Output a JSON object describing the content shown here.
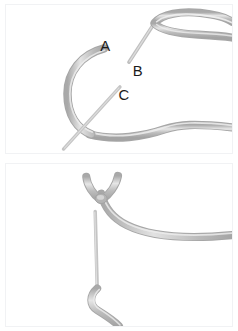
{
  "figure": {
    "type": "instructional-diagram",
    "panel_count": 2,
    "background_color": "#ffffff",
    "panel_border_color": "#f1f2f4"
  },
  "colors": {
    "rope_core": "#b9b9b9",
    "rope_edge": "#a8a8a8",
    "rope_highlight": "#e8e8e8",
    "needle": "#c2c2c2",
    "label": "#1b1b1b",
    "panel_background": "#ffffff"
  },
  "panels": [
    {
      "id": "panel-top",
      "name": "top-panel",
      "step_index": 1,
      "labels": [
        {
          "id": "A",
          "text": "A",
          "x": 100,
          "y": 47
        },
        {
          "id": "B",
          "text": "B",
          "x": 133,
          "y": 72
        },
        {
          "id": "C",
          "text": "C",
          "x": 119,
          "y": 96
        }
      ],
      "elements": [
        {
          "name": "suture-loop",
          "description": "open loop of suture at upper right"
        },
        {
          "name": "suture-curve",
          "description": "large curved suture strand forming a hook"
        },
        {
          "name": "needle-b",
          "description": "straight needle descending from loop toward label B"
        },
        {
          "name": "needle-c",
          "description": "straight needle crossing the curved strand near label C"
        },
        {
          "name": "suture-tail-right",
          "description": "strand exiting to the right edge"
        }
      ]
    },
    {
      "id": "panel-bottom",
      "name": "bottom-panel",
      "step_index": 2,
      "labels": [],
      "elements": [
        {
          "name": "knot-v",
          "description": "V shaped crossing of two suture ends forming a knot"
        },
        {
          "name": "suture-sweep-right",
          "description": "strand sweeping down and out to the right edge"
        },
        {
          "name": "needle-vertical",
          "description": "long vertical needle shaft below the knot"
        },
        {
          "name": "suture-u-loop",
          "description": "U shaped loop of suture at the bottom"
        }
      ]
    }
  ]
}
